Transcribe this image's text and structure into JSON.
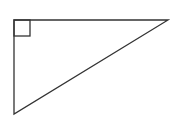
{
  "diagram": {
    "type": "right-triangle",
    "stroke_color": "#333333",
    "background": "#ffffff",
    "vertices": {
      "right_angle": [
        14,
        20
      ],
      "top_right": [
        168,
        20
      ],
      "bottom_left": [
        14,
        114
      ]
    },
    "right_angle_marker": {
      "x": 14,
      "y": 20,
      "size": 16
    }
  }
}
